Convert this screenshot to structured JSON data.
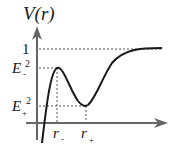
{
  "diagram": {
    "title": "V(r)",
    "y_ticks": [
      {
        "label": "1",
        "value": "1"
      },
      {
        "label": "E_-^2",
        "base": "E",
        "sub": "-",
        "sup": "2"
      },
      {
        "label": "E_+^2",
        "base": "E",
        "sub": "+",
        "sup": "2"
      }
    ],
    "x_ticks": [
      {
        "label": "r_-",
        "base": "r",
        "sub": "-"
      },
      {
        "label": "r_+",
        "base": "r",
        "sub": "+"
      }
    ],
    "curve_description": "Potential rising steeply from below, local maximum E_-^2 at r_-, local minimum E_+^2 at r_+, then asymptotically approaching 1",
    "colors": {
      "axis": "#666666",
      "curve": "#1a1a1a",
      "guide": "#555555"
    }
  }
}
